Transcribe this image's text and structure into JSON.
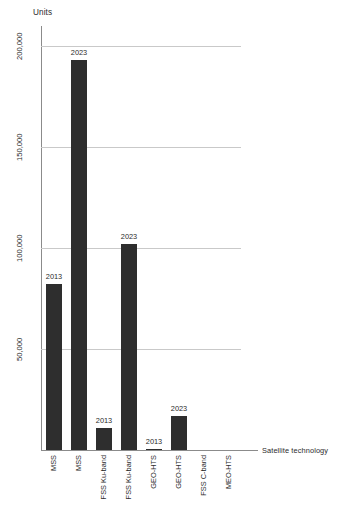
{
  "chart_data": {
    "type": "bar",
    "title": "",
    "subtitle": "",
    "xlabel": "Satellite technology",
    "ylabel": "Units",
    "ylim": [
      0,
      210000
    ],
    "grid": true,
    "legend": "none",
    "y_ticks": [
      "50,000",
      "100,000",
      "150,000",
      "200,000"
    ],
    "y_tick_values": [
      50000,
      100000,
      150000,
      200000
    ],
    "categories": [
      "MSS",
      "MSS",
      "FSS Ku-band",
      "FSS Ku-band",
      "GEO-HTS",
      "GEO-HTS",
      "FSS C-band",
      "MEO-HTS"
    ],
    "values": [
      82000,
      193000,
      11000,
      102000,
      500,
      17000,
      0,
      0
    ],
    "point_labels": [
      "2013",
      "2023",
      "2013",
      "2023",
      "2013",
      "2023",
      "",
      ""
    ],
    "bars": [
      {
        "category": "MSS",
        "year": "2013",
        "value": 82000,
        "label": "2013"
      },
      {
        "category": "MSS",
        "year": "2023",
        "value": 193000,
        "label": "2023"
      },
      {
        "category": "FSS Ku-band",
        "year": "2013",
        "value": 11000,
        "label": "2013"
      },
      {
        "category": "FSS Ku-band",
        "year": "2023",
        "value": 102000,
        "label": "2023"
      },
      {
        "category": "GEO-HTS",
        "year": "2013",
        "value": 500,
        "label": "2013"
      },
      {
        "category": "GEO-HTS",
        "year": "2023",
        "value": 17000,
        "label": "2023"
      },
      {
        "category": "FSS C-band",
        "year": "",
        "value": 0,
        "label": ""
      },
      {
        "category": "MEO-HTS",
        "year": "",
        "value": 0,
        "label": ""
      }
    ],
    "colors": {
      "bar": "#2e2e2e",
      "gridline": "#c9c9c9",
      "axis": "#8b8b8b",
      "text": "#2b2b2b",
      "background": "#ffffff"
    }
  }
}
